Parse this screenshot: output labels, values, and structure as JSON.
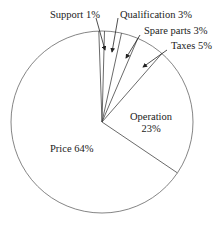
{
  "chart_data": {
    "type": "pie",
    "title": "",
    "categories": [
      "Price",
      "Operation",
      "Taxes",
      "Spare parts",
      "Qualification",
      "Support"
    ],
    "values": [
      64,
      23,
      5,
      3,
      3,
      1
    ],
    "unit": "%",
    "labels": {
      "price": "Price 64%",
      "operation_line1": "Operation",
      "operation_line2": "23%",
      "taxes": "Taxes 5%",
      "spare_parts": "Spare parts 3%",
      "qualification": "Qualification 3%",
      "support": "Support 1%"
    },
    "colors": {
      "fill": "#ffffff",
      "stroke": "#555555",
      "text": "#222222"
    },
    "legend": "none (callout labels with arrows)"
  }
}
